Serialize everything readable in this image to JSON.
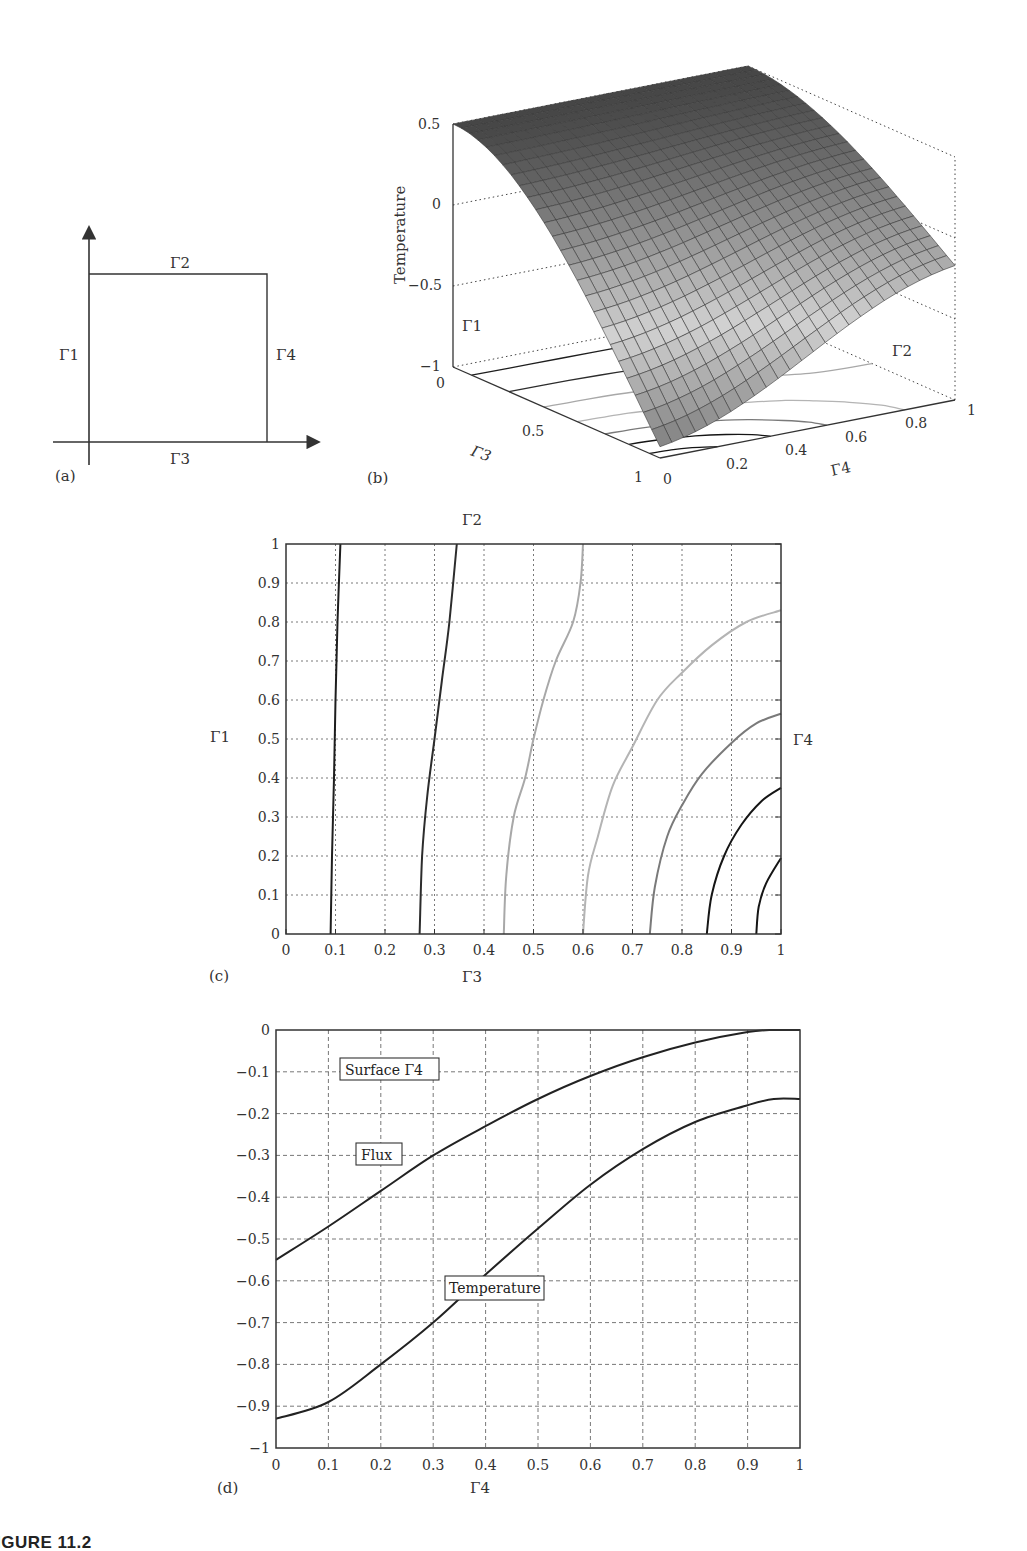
{
  "figure": {
    "caption": "IGURE 11.2",
    "panels": {
      "a": {
        "label": "(a)",
        "boundaries": {
          "left": "Γ1",
          "top": "Γ2",
          "bottom": "Γ3",
          "right": "Γ4"
        }
      },
      "b": {
        "label": "(b)",
        "zlabel": "Temperature",
        "z_ticks": [
          "0.5",
          "0",
          "−0.5",
          "−1"
        ],
        "g3_ticks": [
          "0",
          "0.5",
          "1"
        ],
        "g4_ticks": [
          "0",
          "0.2",
          "0.4",
          "0.6",
          "0.8",
          "1"
        ],
        "axis_g3": "Γ3",
        "axis_g4": "Γ4",
        "edge_g1": "Γ1",
        "edge_g2": "Γ2"
      },
      "c": {
        "label": "(c)",
        "top_label": "Γ2",
        "bottom_label": "Γ3",
        "left_label": "Γ1",
        "right_label": "Γ4"
      },
      "d": {
        "label": "(d)",
        "xlabel": "Γ4",
        "annotations": {
          "surface": "Surface Γ4",
          "flux": "Flux",
          "temperature": "Temperature"
        }
      }
    }
  },
  "chart_data": [
    {
      "panel": "b",
      "type": "surface3d",
      "title": "",
      "xlabel": "Γ4",
      "ylabel": "Γ3",
      "zlabel": "Temperature",
      "xlim": [
        0,
        1
      ],
      "ylim": [
        0,
        1
      ],
      "zlim": [
        -1,
        0.5
      ],
      "z_corners": {
        "g3_0_g4_0": 0.5,
        "g3_0_g4_1": 0.5,
        "g3_1_g4_0": -0.93,
        "g3_1_g4_1": -0.17
      },
      "grid": "mesh 25x25, grayscale shading"
    },
    {
      "panel": "c",
      "type": "contour",
      "title": "",
      "xlabel": "Γ3",
      "ylabel": "Γ1",
      "xlim": [
        0,
        1
      ],
      "ylim": [
        0,
        1
      ],
      "x_ticks": [
        "0",
        "0.1",
        "0.2",
        "0.3",
        "0.4",
        "0.5",
        "0.6",
        "0.7",
        "0.8",
        "0.9",
        "1"
      ],
      "y_ticks": [
        "0",
        "0.1",
        "0.2",
        "0.3",
        "0.4",
        "0.5",
        "0.6",
        "0.7",
        "0.8",
        "0.9",
        "1"
      ],
      "grid": true,
      "contours": [
        {
          "color": "#1e1e1e",
          "points": [
            [
              0.09,
              0
            ],
            [
              0.093,
              0.2
            ],
            [
              0.097,
              0.4
            ],
            [
              0.1,
              0.6
            ],
            [
              0.104,
              0.8
            ],
            [
              0.11,
              1.0
            ]
          ]
        },
        {
          "color": "#2c2c2c",
          "points": [
            [
              0.27,
              0
            ],
            [
              0.275,
              0.2
            ],
            [
              0.285,
              0.35
            ],
            [
              0.3,
              0.5
            ],
            [
              0.315,
              0.65
            ],
            [
              0.33,
              0.8
            ],
            [
              0.345,
              1.0
            ]
          ]
        },
        {
          "color": "#a8a8a8",
          "points": [
            [
              0.44,
              0
            ],
            [
              0.445,
              0.15
            ],
            [
              0.46,
              0.3
            ],
            [
              0.483,
              0.4
            ],
            [
              0.5,
              0.5
            ],
            [
              0.52,
              0.6
            ],
            [
              0.545,
              0.7
            ],
            [
              0.58,
              0.8
            ],
            [
              0.595,
              0.9
            ],
            [
              0.6,
              1.0
            ]
          ]
        },
        {
          "color": "#b4b4b4",
          "points": [
            [
              0.6,
              0
            ],
            [
              0.61,
              0.15
            ],
            [
              0.63,
              0.25
            ],
            [
              0.66,
              0.38
            ],
            [
              0.7,
              0.48
            ],
            [
              0.75,
              0.6
            ],
            [
              0.8,
              0.67
            ],
            [
              0.86,
              0.74
            ],
            [
              0.93,
              0.8
            ],
            [
              1.0,
              0.83
            ]
          ]
        },
        {
          "color": "#7a7a7a",
          "points": [
            [
              0.735,
              0
            ],
            [
              0.745,
              0.12
            ],
            [
              0.77,
              0.25
            ],
            [
              0.8,
              0.33
            ],
            [
              0.84,
              0.41
            ],
            [
              0.9,
              0.49
            ],
            [
              0.95,
              0.54
            ],
            [
              1.0,
              0.565
            ]
          ]
        },
        {
          "color": "#151515",
          "points": [
            [
              0.85,
              0
            ],
            [
              0.86,
              0.1
            ],
            [
              0.885,
              0.2
            ],
            [
              0.92,
              0.28
            ],
            [
              0.96,
              0.34
            ],
            [
              1.0,
              0.375
            ]
          ]
        },
        {
          "color": "#151515",
          "points": [
            [
              0.95,
              0
            ],
            [
              0.955,
              0.07
            ],
            [
              0.97,
              0.13
            ],
            [
              1.0,
              0.195
            ]
          ]
        }
      ]
    },
    {
      "panel": "d",
      "type": "line",
      "title": "",
      "xlabel": "Γ4",
      "ylabel": "",
      "xlim": [
        0,
        1
      ],
      "ylim": [
        -1,
        0
      ],
      "x_ticks": [
        "0",
        "0.1",
        "0.2",
        "0.3",
        "0.4",
        "0.5",
        "0.6",
        "0.7",
        "0.8",
        "0.9",
        "1"
      ],
      "y_ticks": [
        "0",
        "−0.1",
        "−0.2",
        "−0.3",
        "−0.4",
        "−0.5",
        "−0.6",
        "−0.7",
        "−0.8",
        "−0.9",
        "−1"
      ],
      "grid": true,
      "x": [
        0,
        0.1,
        0.2,
        0.3,
        0.4,
        0.5,
        0.6,
        0.7,
        0.8,
        0.9,
        0.95,
        1.0
      ],
      "series": [
        {
          "name": "Flux",
          "values": [
            -0.55,
            -0.47,
            -0.385,
            -0.3,
            -0.23,
            -0.165,
            -0.11,
            -0.065,
            -0.03,
            -0.005,
            0.0,
            0.0
          ]
        },
        {
          "name": "Temperature",
          "values": [
            -0.93,
            -0.89,
            -0.8,
            -0.7,
            -0.585,
            -0.475,
            -0.37,
            -0.285,
            -0.22,
            -0.18,
            -0.165,
            -0.165
          ]
        }
      ]
    }
  ]
}
